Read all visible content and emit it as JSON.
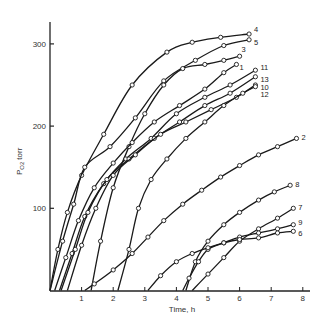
{
  "chart_data": {
    "type": "line",
    "title": "",
    "xlabel": "Time, h",
    "ylabel": "P_O2, torr",
    "xlim": [
      0,
      8.3
    ],
    "ylim": [
      0,
      330
    ],
    "xticks": [
      1,
      2,
      3,
      4,
      5,
      6,
      7,
      8
    ],
    "yticks": [
      100,
      200,
      300
    ],
    "grid": false,
    "legend": "inline labels at curve ends",
    "series": [
      {
        "name": "4",
        "x": [
          0,
          0.25,
          0.55,
          1.0,
          1.7,
          2.6,
          3.7,
          4.5,
          5.4,
          6.3
        ],
        "y": [
          0,
          50,
          95,
          140,
          190,
          250,
          290,
          302,
          308,
          312
        ]
      },
      {
        "name": "5",
        "x": [
          0,
          0.4,
          0.75,
          1.1,
          1.9,
          2.7,
          3.6,
          4.6,
          5.5,
          6.3
        ],
        "y": [
          0,
          60,
          105,
          150,
          175,
          210,
          255,
          280,
          298,
          305
        ]
      },
      {
        "name": "3",
        "x": [
          1.3,
          1.6,
          2.0,
          2.5,
          3.0,
          3.6,
          4.2,
          4.9,
          5.5,
          6.0
        ],
        "y": [
          0,
          60,
          125,
          175,
          215,
          250,
          270,
          275,
          280,
          285
        ]
      },
      {
        "name": "1",
        "x": [
          0.15,
          0.5,
          0.9,
          1.4,
          2.0,
          2.6,
          3.3,
          4.1,
          4.9,
          5.5,
          5.9
        ],
        "y": [
          0,
          40,
          85,
          125,
          155,
          180,
          205,
          225,
          245,
          265,
          275
        ]
      },
      {
        "name": "11",
        "x": [
          0.3,
          0.7,
          1.1,
          1.7,
          2.4,
          3.2,
          4.0,
          4.9,
          5.7,
          6.5
        ],
        "y": [
          0,
          45,
          90,
          130,
          160,
          185,
          215,
          235,
          250,
          268
        ]
      },
      {
        "name": "13",
        "x": [
          0.35,
          0.8,
          1.2,
          1.8,
          2.5,
          3.3,
          4.1,
          4.9,
          5.7,
          6.5
        ],
        "y": [
          0,
          50,
          95,
          135,
          160,
          185,
          205,
          225,
          240,
          260
        ]
      },
      {
        "name": "10",
        "x": [
          0.55,
          1.0,
          1.45,
          2.0,
          2.7,
          3.5,
          4.3,
          5.1,
          5.9,
          6.5
        ],
        "y": [
          0,
          55,
          100,
          140,
          165,
          190,
          205,
          220,
          235,
          250
        ]
      },
      {
        "name": "12",
        "x": [
          2.15,
          2.5,
          2.8,
          3.2,
          3.7,
          4.3,
          4.9,
          5.5,
          6.1,
          6.5
        ],
        "y": [
          0,
          50,
          100,
          135,
          160,
          185,
          205,
          225,
          240,
          248
        ]
      },
      {
        "name": "2",
        "x": [
          1.1,
          1.4,
          2.0,
          2.6,
          3.1,
          3.6,
          4.2,
          4.8,
          5.4,
          6.0,
          6.6,
          7.2,
          7.8
        ],
        "y": [
          0,
          8,
          25,
          45,
          65,
          85,
          105,
          122,
          138,
          152,
          165,
          175,
          185
        ]
      },
      {
        "name": "8",
        "x": [
          4.3,
          4.6,
          5.0,
          5.5,
          6.0,
          6.6,
          7.1,
          7.6
        ],
        "y": [
          0,
          35,
          60,
          80,
          95,
          110,
          120,
          128
        ]
      },
      {
        "name": "7",
        "x": [
          4.5,
          5.0,
          5.5,
          6.0,
          6.6,
          7.2,
          7.7
        ],
        "y": [
          0,
          20,
          40,
          60,
          75,
          88,
          100
        ]
      },
      {
        "name": "9",
        "x": [
          4.2,
          4.4,
          4.7,
          5.0,
          5.5,
          6.0,
          6.6,
          7.2,
          7.7
        ],
        "y": [
          0,
          15,
          35,
          50,
          58,
          65,
          70,
          75,
          80
        ]
      },
      {
        "name": "6",
        "x": [
          3.1,
          3.5,
          4.0,
          4.5,
          5.0,
          5.5,
          6.0,
          6.6,
          7.2,
          7.7
        ],
        "y": [
          0,
          18,
          35,
          45,
          52,
          58,
          62,
          64,
          70,
          72
        ]
      }
    ],
    "marker": "open-circle"
  },
  "axes": {
    "x_title": "Time, h",
    "y_title_main": "P",
    "y_title_sub": "O2",
    "y_title_unit": "torr"
  }
}
